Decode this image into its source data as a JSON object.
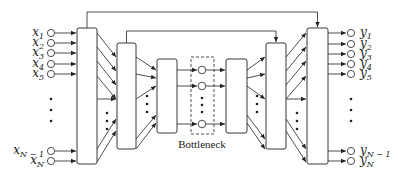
{
  "diagram": {
    "type": "autoencoder-with-skip-connections",
    "inputs": [
      {
        "base": "x",
        "sub": "1",
        "y": 33
      },
      {
        "base": "x",
        "sub": "2",
        "y": 43
      },
      {
        "base": "x",
        "sub": "3",
        "y": 53
      },
      {
        "base": "x",
        "sub": "4",
        "y": 64
      },
      {
        "base": "x",
        "sub": "5",
        "y": 74
      },
      {
        "base": "x",
        "sub": "N − 1",
        "y": 151
      },
      {
        "base": "x",
        "sub": "N",
        "y": 161
      }
    ],
    "outputs": [
      {
        "base": "y",
        "sub": "1",
        "y": 33
      },
      {
        "base": "y",
        "sub": "2",
        "y": 44
      },
      {
        "base": "y",
        "sub": "3",
        "y": 54
      },
      {
        "base": "y",
        "sub": "4",
        "y": 64
      },
      {
        "base": "y",
        "sub": "5",
        "y": 74
      },
      {
        "base": "y",
        "sub": "N − 1",
        "y": 151
      },
      {
        "base": "y",
        "sub": "N",
        "y": 161
      }
    ],
    "blocks": [
      {
        "id": "encoder-1",
        "x": 77,
        "y": 28,
        "w": 20,
        "h": 136
      },
      {
        "id": "encoder-2",
        "x": 117,
        "y": 43,
        "w": 19,
        "h": 106
      },
      {
        "id": "encoder-3",
        "x": 157,
        "y": 59,
        "w": 20,
        "h": 74
      },
      {
        "id": "decoder-1",
        "x": 226,
        "y": 59,
        "w": 21,
        "h": 74
      },
      {
        "id": "decoder-2",
        "x": 266,
        "y": 43,
        "w": 20,
        "h": 106
      },
      {
        "id": "decoder-3",
        "x": 307,
        "y": 28,
        "w": 21,
        "h": 136
      }
    ],
    "bottleneck": {
      "label": "Bottleneck",
      "box": {
        "x": 191,
        "y": 57,
        "w": 23,
        "h": 77
      },
      "nodes_y": [
        70,
        86,
        124
      ]
    },
    "skip_connections": [
      {
        "from": "encoder-1",
        "to": "decoder-3",
        "y": 12
      },
      {
        "from": "encoder-2",
        "to": "decoder-2",
        "y": 31
      }
    ],
    "ellipsis": "⋮"
  }
}
